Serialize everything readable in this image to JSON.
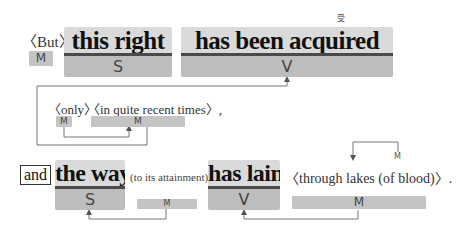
{
  "sentence1": {
    "intro_paren": "〈But〉",
    "intro_role": "M",
    "subject": {
      "text": "this right",
      "role": "S"
    },
    "verb": {
      "text": "has been acquired",
      "role": "V",
      "annotation": "受"
    }
  },
  "inset": {
    "paren1": "〈only〉",
    "paren2": "〈in quite recent times〉,",
    "role1": "M",
    "role2": "M"
  },
  "sentence2": {
    "conjunction": "and",
    "subject": {
      "text": "the way",
      "role": "S"
    },
    "subject_modifier": {
      "text": "(to its attainment)",
      "role": "M"
    },
    "verb": {
      "text": "has lain",
      "role": "V"
    },
    "adverbial": {
      "text": "〈through lakes (of blood)〉.",
      "role": "M",
      "inner_role": "M"
    }
  },
  "colors": {
    "word_top": "#dadada",
    "word_role": "#bdbdbd",
    "underline": "#4a4a4a",
    "badge": "#c4c4c4",
    "connector": "#666666"
  }
}
